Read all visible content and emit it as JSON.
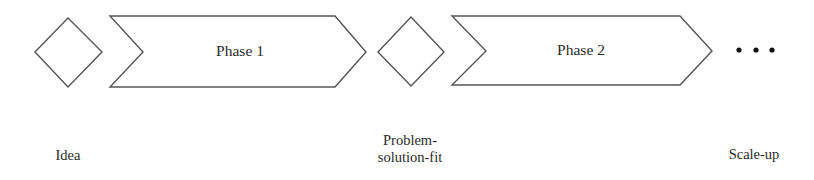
{
  "diagram": {
    "type": "process-flow",
    "milestones": [
      {
        "label": "Idea",
        "shape": "diamond"
      },
      {
        "label_line1": "Problem-",
        "label_line2": "solution-fit",
        "shape": "diamond"
      },
      {
        "label": "Scale-up",
        "shape": "ellipsis"
      }
    ],
    "phases": [
      {
        "label": "Phase 1",
        "shape": "chevron"
      },
      {
        "label": "Phase 2",
        "shape": "chevron"
      }
    ],
    "continuation": "ellipsis-dots",
    "colors": {
      "stroke": "#555555",
      "fill": "#ffffff",
      "text": "#2a2a2a"
    }
  }
}
